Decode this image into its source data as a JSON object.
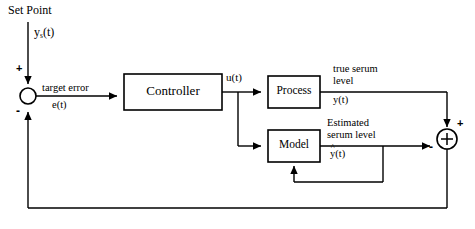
{
  "diagram": {
    "type": "control-block-diagram",
    "line_color": "#000000",
    "fill_color": "#ffffff",
    "blocks": [
      {
        "id": "controller",
        "label": "Controller",
        "x": 124,
        "y": 74,
        "w": 98,
        "h": 36
      },
      {
        "id": "process",
        "label": "Process",
        "x": 268,
        "y": 76,
        "w": 52,
        "h": 32
      },
      {
        "id": "model",
        "label": "Model",
        "x": 268,
        "y": 130,
        "w": 52,
        "h": 32
      }
    ],
    "junctions": [
      {
        "id": "error-junction",
        "glyph": "",
        "cx": 28,
        "cy": 96,
        "r": 8,
        "plus_label": "+",
        "minus_label": "-"
      },
      {
        "id": "residual-junction",
        "glyph": "+",
        "cx": 447,
        "cy": 139,
        "r": 10,
        "plus_label": "+",
        "minus_label": "-"
      }
    ],
    "labels": {
      "set_point": "Set Point",
      "set_point_signal_base": "y",
      "set_point_signal_sub": "s",
      "set_point_signal_arg": "(t)",
      "target_error": "target error",
      "error_signal": "e(t)",
      "control_signal": "u(t)",
      "true_serum_line1": "true serum",
      "true_serum_line2": "level",
      "true_serum_signal": "y(t)",
      "estimated_line1": "Estimated",
      "estimated_line2": "serum level",
      "estimated_signal_base": "y",
      "estimated_signal_arg": "(t)",
      "estimated_signal_hat": "^",
      "plus_top_left": "+",
      "minus_bottom_left": "-",
      "plus_right": "+",
      "minus_right": "-"
    }
  }
}
